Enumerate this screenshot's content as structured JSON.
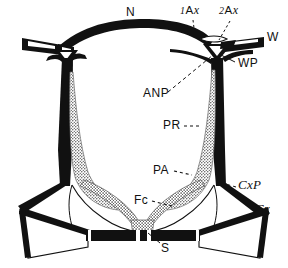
{
  "figure": {
    "caption_absent": true,
    "background_color": "#ffffff",
    "ink_color": "#111111",
    "stipple_color": "#9a9a9a",
    "width": 288,
    "height": 268
  },
  "labels": [
    {
      "id": "N",
      "text": "N",
      "x": 128,
      "y": 12,
      "style": "sans",
      "leader": false
    },
    {
      "id": "1Ax",
      "num": "1",
      "abbr": "A",
      "ital": "x",
      "x": 184,
      "y": 8,
      "style": "mixed",
      "leader": true
    },
    {
      "id": "2Ax",
      "num": "2",
      "abbr": "A",
      "ital": "x",
      "x": 222,
      "y": 8,
      "style": "mixed",
      "leader": true
    },
    {
      "id": "W",
      "text": "W",
      "x": 268,
      "y": 36,
      "style": "sans",
      "leader": false
    },
    {
      "id": "WP",
      "text": "WP",
      "x": 238,
      "y": 61,
      "style": "sans",
      "leader": true
    },
    {
      "id": "ANP",
      "text": "ANP",
      "x": 150,
      "y": 92,
      "style": "sans",
      "leader": true
    },
    {
      "id": "PR",
      "text": "PR",
      "x": 166,
      "y": 121,
      "style": "sans",
      "leader": true
    },
    {
      "id": "PA",
      "text": "PA",
      "x": 155,
      "y": 166,
      "style": "sans",
      "leader": true
    },
    {
      "id": "Fc",
      "text": "Fc",
      "x": 136,
      "y": 196,
      "style": "sans",
      "leader": true
    },
    {
      "id": "CxP",
      "text": "CxP",
      "x": 239,
      "y": 184,
      "style": "serif-italic",
      "leader": true
    },
    {
      "id": "Cx",
      "text": "Cx",
      "x": 256,
      "y": 207,
      "style": "serif-italic",
      "leader": false
    },
    {
      "id": "S",
      "text": "S",
      "x": 163,
      "y": 245,
      "style": "sans",
      "leader": true
    }
  ],
  "label_text": {
    "N": "N",
    "first_axillary_prefix": "1",
    "first_axillary_body": "A",
    "first_axillary_suffix": "x",
    "second_axillary_prefix": "2",
    "second_axillary_body": "A",
    "second_axillary_suffix": "x",
    "W": "W",
    "WP": "WP",
    "ANP": "ANP",
    "PR": "PR",
    "PA": "PA",
    "Fc": "Fc",
    "CxP": "CxP",
    "Cx": "Cx",
    "S": "S"
  }
}
